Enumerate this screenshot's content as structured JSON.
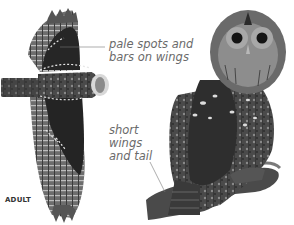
{
  "illustrations": [
    {
      "name": "flying-owl",
      "view": "dorsal, wings spread"
    },
    {
      "name": "perched-owl",
      "view": "perched on branch"
    }
  ],
  "annotations": [
    {
      "id": "pale",
      "lines": [
        "pale spots and",
        "bars on wings"
      ]
    },
    {
      "id": "short",
      "lines": [
        "short",
        "wings",
        "and tail"
      ]
    }
  ],
  "annotation_text": {
    "pale": "pale spots and\nbars on wings",
    "short": "short\nwings\nand tail"
  },
  "caption": "ADULT",
  "colors": {
    "background": "#ffffff",
    "label_text": "#6a6a6a",
    "leader_line": "#777777",
    "plumage_dark": "#2a2a2a",
    "plumage_mid": "#5a5a5a",
    "plumage_light": "#9a9a9a"
  }
}
